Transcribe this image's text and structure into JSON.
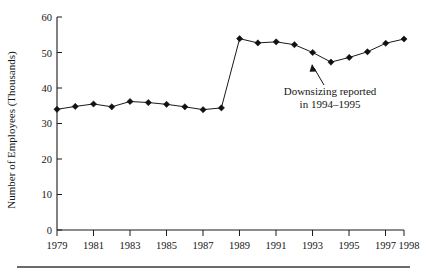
{
  "chart_data": {
    "type": "line",
    "title": "",
    "xlabel": "",
    "ylabel": "Number of Employees (Thousands)",
    "x": [
      1979,
      1980,
      1981,
      1982,
      1983,
      1984,
      1985,
      1986,
      1987,
      1988,
      1989,
      1990,
      1991,
      1992,
      1993,
      1994,
      1995,
      1996,
      1997,
      1998
    ],
    "values": [
      34.0,
      34.8,
      35.5,
      34.7,
      36.2,
      35.9,
      35.4,
      34.7,
      33.9,
      34.4,
      53.9,
      52.7,
      53.0,
      52.2,
      50.0,
      47.3,
      48.6,
      50.2,
      52.6,
      53.8
    ],
    "series": [
      {
        "name": "Number of Employees",
        "values": [
          34.0,
          34.8,
          35.5,
          34.7,
          36.2,
          35.9,
          35.4,
          34.7,
          33.9,
          34.4,
          53.9,
          52.7,
          53.0,
          52.2,
          50.0,
          47.3,
          48.6,
          50.2,
          52.6,
          53.8
        ]
      }
    ],
    "ylim": [
      0,
      60
    ],
    "xlim": [
      1979,
      1998
    ],
    "yticks": [
      0,
      10,
      20,
      30,
      40,
      50,
      60
    ],
    "ytick_labels": [
      "0",
      "10",
      "20",
      "30",
      "40",
      "50",
      "60"
    ],
    "xticks": [
      1979,
      1981,
      1983,
      1985,
      1987,
      1989,
      1991,
      1993,
      1995,
      1997,
      1998
    ],
    "xtick_labels": [
      "1979",
      "1981",
      "1983",
      "1985",
      "1987",
      "1989",
      "1991",
      "1993",
      "1995",
      "1997",
      "1998"
    ],
    "grid": false,
    "legend": "none",
    "marker": "diamond",
    "annotations": [
      {
        "line1": "Downsizing reported",
        "line2": "in 1994–1995",
        "points_to_year": 1994,
        "points_to_value": 47.3
      }
    ]
  },
  "axes": {
    "y_title": "Number of Employees (Thousands)"
  },
  "colors": {
    "line": "#1a1a1a",
    "marker": "#111111",
    "text": "#151515",
    "background": "#ffffff",
    "rule": "#3a3a3a"
  }
}
